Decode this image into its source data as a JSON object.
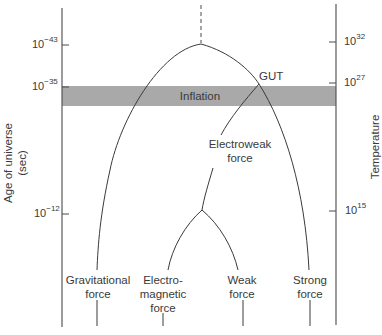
{
  "diagram": {
    "left_axis": {
      "title_line1": "Age of universe",
      "title_line2": "(sec)",
      "ticks": [
        {
          "base": "10",
          "exp": "−43"
        },
        {
          "base": "10",
          "exp": "−35"
        },
        {
          "base": "10",
          "exp": "−12"
        }
      ]
    },
    "right_axis": {
      "title": "Temperature",
      "ticks": [
        {
          "base": "10",
          "exp": "32"
        },
        {
          "base": "10",
          "exp": "27"
        },
        {
          "base": "10",
          "exp": "15"
        }
      ]
    },
    "band": {
      "label": "Inflation",
      "color": "#a9a9a9"
    },
    "junctions": {
      "gut": "GUT",
      "electroweak_line1": "Electroweak",
      "electroweak_line2": "force"
    },
    "forces": [
      {
        "line1": "Gravitational",
        "line2": "force"
      },
      {
        "line1": "Electro-",
        "line2": "magnetic",
        "line3": "force"
      },
      {
        "line1": "Weak",
        "line2": "force"
      },
      {
        "line1": "Strong",
        "line2": "force"
      }
    ],
    "line_color": "#3a3a3a"
  }
}
